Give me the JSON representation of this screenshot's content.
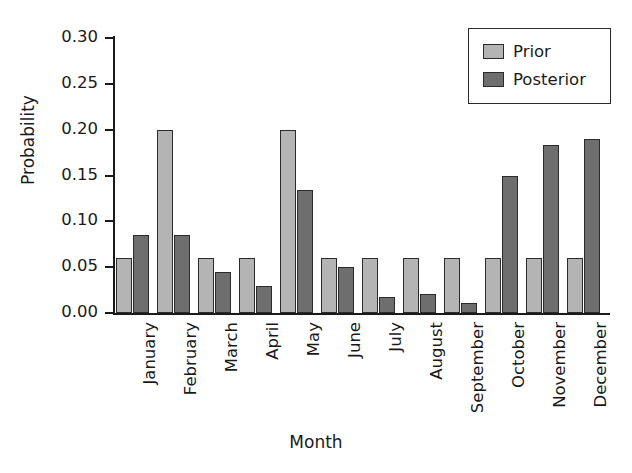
{
  "chart_data": {
    "type": "bar",
    "title": "",
    "xlabel": "Month",
    "ylabel": "Probability",
    "ylim": [
      0.0,
      0.3
    ],
    "yticks": [
      "0.00",
      "0.05",
      "0.10",
      "0.15",
      "0.20",
      "0.25",
      "0.30"
    ],
    "ytick_values": [
      0.0,
      0.05,
      0.1,
      0.15,
      0.2,
      0.25,
      0.3
    ],
    "grid": false,
    "legend_position": "top-right",
    "categories": [
      "January",
      "February",
      "March",
      "April",
      "May",
      "June",
      "July",
      "August",
      "September",
      "October",
      "November",
      "December"
    ],
    "series": [
      {
        "name": "Prior",
        "color": "#b4b4b4",
        "values": [
          0.06,
          0.2,
          0.06,
          0.06,
          0.2,
          0.06,
          0.06,
          0.06,
          0.06,
          0.06,
          0.06,
          0.06
        ]
      },
      {
        "name": "Posterior",
        "color": "#6e6e6e",
        "values": [
          0.085,
          0.085,
          0.045,
          0.03,
          0.134,
          0.05,
          0.017,
          0.021,
          0.011,
          0.149,
          0.183,
          0.19
        ]
      }
    ]
  },
  "legend": {
    "entries": [
      {
        "label": "Prior"
      },
      {
        "label": "Posterior"
      }
    ]
  }
}
